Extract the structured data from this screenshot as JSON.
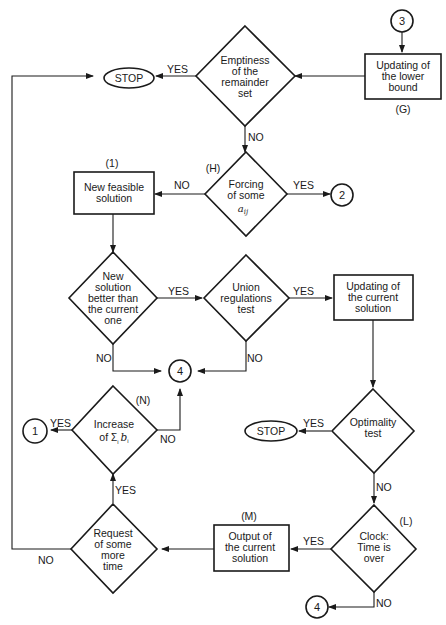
{
  "diagram": {
    "nodes": {
      "connector_3_top": "3",
      "update_lower_bound": [
        "Updating of",
        "the lower",
        "bound"
      ],
      "update_lower_bound_tag": "(G)",
      "emptiness": [
        "Emptiness",
        "of the",
        "remainder",
        "set"
      ],
      "stop_top": "STOP",
      "forcing": [
        "Forcing",
        "of some"
      ],
      "forcing_var": "a",
      "forcing_sub": "ij",
      "forcing_tag": "(H)",
      "connector_2": "2",
      "new_feasible": [
        "New feasible",
        "solution"
      ],
      "new_feasible_tag": "(1)",
      "new_better": [
        "New",
        "solution",
        "better than",
        "the current",
        "one"
      ],
      "union": [
        "Union",
        "regulations",
        "test"
      ],
      "update_current": [
        "Updating of",
        "the current",
        "solution"
      ],
      "connector_4_mid": "4",
      "increase": [
        "Increase"
      ],
      "increase_expr_prefix": "of",
      "increase_expr_sum": "Σ",
      "increase_expr_sub": "i",
      "increase_expr_var": "b",
      "increase_expr_var_sub": "i",
      "increase_tag": "(N)",
      "connector_1": "1",
      "optimality": [
        "Optimality",
        "test"
      ],
      "stop_mid": "STOP",
      "clock": [
        "Clock:",
        "Time is",
        "over"
      ],
      "clock_tag": "(L)",
      "output_current": [
        "Output of",
        "the current",
        "solution"
      ],
      "output_current_tag": "(M)",
      "request_time": [
        "Request",
        "of some",
        "more",
        "time"
      ],
      "connector_4_bottom": "4"
    },
    "edge_labels": {
      "emptiness_yes": "YES",
      "emptiness_no": "NO",
      "forcing_no": "NO",
      "forcing_yes": "YES",
      "better_yes": "YES",
      "better_no": "NO",
      "union_yes": "YES",
      "union_no": "NO",
      "increase_yes": "YES",
      "increase_no": "NO",
      "optimality_yes": "YES",
      "optimality_no": "NO",
      "clock_yes": "YES",
      "clock_no": "NO",
      "request_yes": "YES",
      "request_no": "NO"
    }
  }
}
